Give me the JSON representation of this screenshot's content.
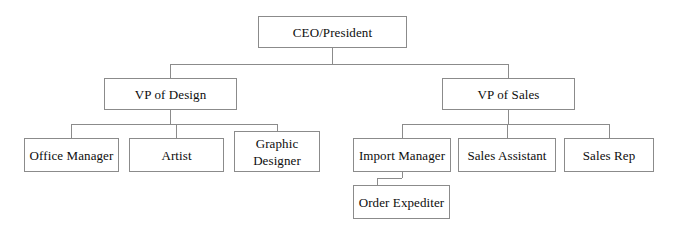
{
  "chart": {
    "type": "org-chart",
    "background_color": "#ffffff",
    "line_color": "#8b8b8b",
    "box_border_color": "#8b8b8b",
    "text_color": "#0d0d0d",
    "nodes": [
      {
        "id": "ceo",
        "label": "CEO/President",
        "level": 0,
        "parent": null,
        "x": 258,
        "y": 16,
        "w": 149,
        "h": 32
      },
      {
        "id": "vp-design",
        "label": "VP of Design",
        "level": 1,
        "parent": "ceo",
        "x": 104,
        "y": 78,
        "w": 133,
        "h": 32
      },
      {
        "id": "vp-sales",
        "label": "VP of Sales",
        "level": 1,
        "parent": "ceo",
        "x": 442,
        "y": 78,
        "w": 133,
        "h": 32
      },
      {
        "id": "office-manager",
        "label": "Office Manager",
        "level": 2,
        "parent": "vp-design",
        "x": 24,
        "y": 138,
        "w": 95,
        "h": 34
      },
      {
        "id": "artist",
        "label": "Artist",
        "level": 2,
        "parent": "vp-design",
        "x": 129,
        "y": 138,
        "w": 95,
        "h": 34
      },
      {
        "id": "graphic-designer",
        "label": "Graphic\nDesigner",
        "level": 2,
        "parent": "vp-design",
        "x": 234,
        "y": 131,
        "w": 86,
        "h": 41
      },
      {
        "id": "import-manager",
        "label": "Import Manager",
        "level": 2,
        "parent": "vp-sales",
        "x": 353,
        "y": 138,
        "w": 98,
        "h": 34
      },
      {
        "id": "sales-assistant",
        "label": "Sales Assistant",
        "level": 2,
        "parent": "vp-sales",
        "x": 458,
        "y": 138,
        "w": 98,
        "h": 34
      },
      {
        "id": "sales-rep",
        "label": "Sales Rep",
        "level": 2,
        "parent": "vp-sales",
        "x": 564,
        "y": 138,
        "w": 90,
        "h": 34
      },
      {
        "id": "order-expediter",
        "label": "Order Expediter",
        "level": 3,
        "parent": "import-manager",
        "x": 353,
        "y": 185,
        "w": 97,
        "h": 34
      }
    ],
    "connectors": [
      {
        "name": "ceo-stem-down",
        "x1": 332,
        "y1": 48,
        "x2": 332,
        "y2": 64
      },
      {
        "name": "ceo-bus-horizontal",
        "x1": 170,
        "y1": 64,
        "x2": 508,
        "y2": 64
      },
      {
        "name": "vp-design-stem-up",
        "x1": 170,
        "y1": 64,
        "x2": 170,
        "y2": 78
      },
      {
        "name": "vp-sales-stem-up",
        "x1": 508,
        "y1": 64,
        "x2": 508,
        "y2": 78
      },
      {
        "name": "vp-design-stem-down",
        "x1": 170,
        "y1": 110,
        "x2": 170,
        "y2": 124
      },
      {
        "name": "design-bus-horizontal",
        "x1": 71,
        "y1": 124,
        "x2": 277,
        "y2": 124
      },
      {
        "name": "office-manager-stem-up",
        "x1": 71,
        "y1": 124,
        "x2": 71,
        "y2": 138
      },
      {
        "name": "artist-stem-up",
        "x1": 176,
        "y1": 124,
        "x2": 176,
        "y2": 138
      },
      {
        "name": "graphic-designer-stem-up",
        "x1": 277,
        "y1": 124,
        "x2": 277,
        "y2": 131
      },
      {
        "name": "vp-sales-stem-down",
        "x1": 508,
        "y1": 110,
        "x2": 508,
        "y2": 124
      },
      {
        "name": "sales-bus-horizontal",
        "x1": 402,
        "y1": 124,
        "x2": 609,
        "y2": 124
      },
      {
        "name": "import-manager-stem-up",
        "x1": 402,
        "y1": 124,
        "x2": 402,
        "y2": 138
      },
      {
        "name": "sales-assistant-stem-up",
        "x1": 507,
        "y1": 124,
        "x2": 507,
        "y2": 138
      },
      {
        "name": "sales-rep-stem-up",
        "x1": 609,
        "y1": 124,
        "x2": 609,
        "y2": 138
      },
      {
        "name": "import-manager-stem-down",
        "x1": 402,
        "y1": 172,
        "x2": 402,
        "y2": 178
      },
      {
        "name": "order-expediter-bus",
        "x1": 377,
        "y1": 178,
        "x2": 402,
        "y2": 178
      },
      {
        "name": "order-expediter-stem-up",
        "x1": 377,
        "y1": 178,
        "x2": 377,
        "y2": 185
      }
    ]
  }
}
